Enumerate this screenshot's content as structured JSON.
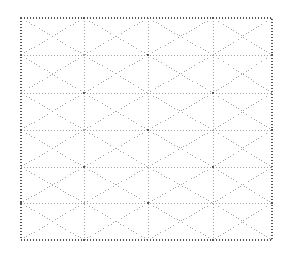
{
  "figure": {
    "title": "",
    "caption": "",
    "background_color": "#ffffff"
  },
  "chart_data": {
    "type": "diagram",
    "subtype": "triangular-lattice-mesh",
    "title": "",
    "xlabel": "",
    "ylabel": "",
    "grid": true,
    "legend": null,
    "annotations": [],
    "style": {
      "line_color": "#9a9a9a",
      "border_color": "#555555",
      "line_dash": "1 2",
      "border_dash": "1 2",
      "line_width": 0.9,
      "border_width": 1.3,
      "vertex_marker_color": "#555555",
      "vertex_marker_size": 2.2
    },
    "domain": {
      "x_min": 21,
      "x_max": 272,
      "y_min": 18,
      "y_max": 240,
      "columns": 4,
      "rows": 6
    },
    "x_ticks": [
      21,
      84,
      148,
      213,
      272
    ],
    "y_ticks": [
      18,
      55,
      93,
      130,
      167,
      203,
      240
    ],
    "nodes": [
      {
        "id": 0,
        "x": 21,
        "y": 18
      },
      {
        "id": 1,
        "x": 84,
        "y": 18
      },
      {
        "id": 2,
        "x": 148,
        "y": 18
      },
      {
        "id": 3,
        "x": 213,
        "y": 18
      },
      {
        "id": 4,
        "x": 272,
        "y": 18
      },
      {
        "id": 5,
        "x": 21,
        "y": 55
      },
      {
        "id": 6,
        "x": 52,
        "y": 55
      },
      {
        "id": 7,
        "x": 116,
        "y": 55
      },
      {
        "id": 8,
        "x": 181,
        "y": 55
      },
      {
        "id": 9,
        "x": 244,
        "y": 55
      },
      {
        "id": 10,
        "x": 272,
        "y": 55
      },
      {
        "id": 11,
        "x": 21,
        "y": 93
      },
      {
        "id": 12,
        "x": 84,
        "y": 93
      },
      {
        "id": 13,
        "x": 148,
        "y": 93
      },
      {
        "id": 14,
        "x": 213,
        "y": 93
      },
      {
        "id": 15,
        "x": 272,
        "y": 93
      },
      {
        "id": 16,
        "x": 21,
        "y": 130
      },
      {
        "id": 17,
        "x": 52,
        "y": 130
      },
      {
        "id": 18,
        "x": 116,
        "y": 130
      },
      {
        "id": 19,
        "x": 181,
        "y": 130
      },
      {
        "id": 20,
        "x": 244,
        "y": 130
      },
      {
        "id": 21,
        "x": 272,
        "y": 130
      },
      {
        "id": 22,
        "x": 21,
        "y": 167
      },
      {
        "id": 23,
        "x": 84,
        "y": 167
      },
      {
        "id": 24,
        "x": 148,
        "y": 167
      },
      {
        "id": 25,
        "x": 213,
        "y": 167
      },
      {
        "id": 26,
        "x": 272,
        "y": 167
      },
      {
        "id": 27,
        "x": 21,
        "y": 203
      },
      {
        "id": 28,
        "x": 52,
        "y": 203
      },
      {
        "id": 29,
        "x": 116,
        "y": 203
      },
      {
        "id": 30,
        "x": 181,
        "y": 203
      },
      {
        "id": 31,
        "x": 244,
        "y": 203
      },
      {
        "id": 32,
        "x": 272,
        "y": 203
      },
      {
        "id": 33,
        "x": 21,
        "y": 240
      },
      {
        "id": 34,
        "x": 84,
        "y": 240
      },
      {
        "id": 35,
        "x": 148,
        "y": 240
      },
      {
        "id": 36,
        "x": 213,
        "y": 240
      },
      {
        "id": 37,
        "x": 272,
        "y": 240
      }
    ],
    "vertex_markers": [
      {
        "x": 84,
        "y": 18
      },
      {
        "x": 213,
        "y": 18
      },
      {
        "x": 21,
        "y": 55
      },
      {
        "x": 148,
        "y": 55
      },
      {
        "x": 272,
        "y": 55
      },
      {
        "x": 84,
        "y": 93
      },
      {
        "x": 213,
        "y": 93
      },
      {
        "x": 21,
        "y": 130
      },
      {
        "x": 148,
        "y": 130
      },
      {
        "x": 272,
        "y": 130
      },
      {
        "x": 84,
        "y": 167
      },
      {
        "x": 213,
        "y": 167
      },
      {
        "x": 21,
        "y": 203
      },
      {
        "x": 148,
        "y": 203
      },
      {
        "x": 272,
        "y": 203
      },
      {
        "x": 84,
        "y": 240
      },
      {
        "x": 213,
        "y": 240
      }
    ],
    "vertical_lines": [
      {
        "x": 84,
        "y1": 18,
        "y2": 240
      },
      {
        "x": 148,
        "y1": 18,
        "y2": 240
      },
      {
        "x": 213,
        "y1": 18,
        "y2": 240
      }
    ],
    "horizontal_lines": [
      {
        "y": 55,
        "x1": 21,
        "x2": 272
      },
      {
        "y": 93,
        "x1": 21,
        "x2": 272
      },
      {
        "y": 130,
        "x1": 21,
        "x2": 272
      },
      {
        "y": 167,
        "x1": 21,
        "x2": 272
      },
      {
        "y": 203,
        "x1": 21,
        "x2": 272
      }
    ],
    "diagonal_lines": [
      {
        "x1": 21,
        "y1": 18,
        "x2": 84,
        "y2": 55
      },
      {
        "x1": 84,
        "y1": 18,
        "x2": 148,
        "y2": 55
      },
      {
        "x1": 148,
        "y1": 18,
        "x2": 213,
        "y2": 55
      },
      {
        "x1": 213,
        "y1": 18,
        "x2": 272,
        "y2": 55
      },
      {
        "x1": 84,
        "y1": 18,
        "x2": 21,
        "y2": 55
      },
      {
        "x1": 148,
        "y1": 18,
        "x2": 84,
        "y2": 55
      },
      {
        "x1": 213,
        "y1": 18,
        "x2": 148,
        "y2": 55
      },
      {
        "x1": 272,
        "y1": 18,
        "x2": 213,
        "y2": 55
      },
      {
        "x1": 21,
        "y1": 55,
        "x2": 84,
        "y2": 93
      },
      {
        "x1": 84,
        "y1": 55,
        "x2": 148,
        "y2": 93
      },
      {
        "x1": 148,
        "y1": 55,
        "x2": 213,
        "y2": 93
      },
      {
        "x1": 213,
        "y1": 55,
        "x2": 272,
        "y2": 93
      },
      {
        "x1": 84,
        "y1": 55,
        "x2": 21,
        "y2": 93
      },
      {
        "x1": 148,
        "y1": 55,
        "x2": 84,
        "y2": 93
      },
      {
        "x1": 213,
        "y1": 55,
        "x2": 148,
        "y2": 93
      },
      {
        "x1": 272,
        "y1": 55,
        "x2": 213,
        "y2": 93
      },
      {
        "x1": 21,
        "y1": 93,
        "x2": 84,
        "y2": 130
      },
      {
        "x1": 84,
        "y1": 93,
        "x2": 148,
        "y2": 130
      },
      {
        "x1": 148,
        "y1": 93,
        "x2": 213,
        "y2": 130
      },
      {
        "x1": 213,
        "y1": 93,
        "x2": 272,
        "y2": 130
      },
      {
        "x1": 84,
        "y1": 93,
        "x2": 21,
        "y2": 130
      },
      {
        "x1": 148,
        "y1": 93,
        "x2": 84,
        "y2": 130
      },
      {
        "x1": 213,
        "y1": 93,
        "x2": 148,
        "y2": 130
      },
      {
        "x1": 272,
        "y1": 93,
        "x2": 213,
        "y2": 130
      },
      {
        "x1": 21,
        "y1": 130,
        "x2": 84,
        "y2": 167
      },
      {
        "x1": 84,
        "y1": 130,
        "x2": 148,
        "y2": 167
      },
      {
        "x1": 148,
        "y1": 130,
        "x2": 213,
        "y2": 167
      },
      {
        "x1": 213,
        "y1": 130,
        "x2": 272,
        "y2": 167
      },
      {
        "x1": 84,
        "y1": 130,
        "x2": 21,
        "y2": 167
      },
      {
        "x1": 148,
        "y1": 130,
        "x2": 84,
        "y2": 167
      },
      {
        "x1": 213,
        "y1": 130,
        "x2": 148,
        "y2": 167
      },
      {
        "x1": 272,
        "y1": 130,
        "x2": 213,
        "y2": 167
      },
      {
        "x1": 21,
        "y1": 167,
        "x2": 84,
        "y2": 203
      },
      {
        "x1": 84,
        "y1": 167,
        "x2": 148,
        "y2": 203
      },
      {
        "x1": 148,
        "y1": 167,
        "x2": 213,
        "y2": 203
      },
      {
        "x1": 213,
        "y1": 167,
        "x2": 272,
        "y2": 203
      },
      {
        "x1": 84,
        "y1": 167,
        "x2": 21,
        "y2": 203
      },
      {
        "x1": 148,
        "y1": 167,
        "x2": 84,
        "y2": 203
      },
      {
        "x1": 213,
        "y1": 167,
        "x2": 148,
        "y2": 203
      },
      {
        "x1": 272,
        "y1": 167,
        "x2": 213,
        "y2": 203
      },
      {
        "x1": 21,
        "y1": 203,
        "x2": 84,
        "y2": 240
      },
      {
        "x1": 84,
        "y1": 203,
        "x2": 148,
        "y2": 240
      },
      {
        "x1": 148,
        "y1": 203,
        "x2": 213,
        "y2": 240
      },
      {
        "x1": 213,
        "y1": 203,
        "x2": 272,
        "y2": 240
      },
      {
        "x1": 84,
        "y1": 203,
        "x2": 21,
        "y2": 240
      },
      {
        "x1": 148,
        "y1": 203,
        "x2": 84,
        "y2": 240
      },
      {
        "x1": 213,
        "y1": 203,
        "x2": 148,
        "y2": 240
      },
      {
        "x1": 272,
        "y1": 203,
        "x2": 213,
        "y2": 240
      }
    ],
    "border": {
      "x": 21,
      "y": 18,
      "width": 251,
      "height": 222
    }
  }
}
